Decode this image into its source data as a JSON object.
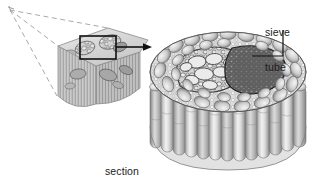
{
  "figure": {
    "background_color": "#ffffff",
    "ink_color": "#1b1b1b"
  },
  "labels": {
    "sieve_tube": {
      "line1": "sieve",
      "line2": "tube",
      "leader": "vertical-then-horizontal-left"
    },
    "section_from_stem": {
      "line1": "section",
      "line2": "from",
      "line3": "a stem"
    }
  },
  "annotations": {
    "magnify_arrow": "arrow-right",
    "magnify_box": "highlight-rectangle-on-stem",
    "projection_lines": "dashed-cone-to-left-vanishing-point"
  },
  "structures": {
    "stem_block": "cut wedge of stem with vertical striations and vascular bundles",
    "cylinder": "magnified cylindrical tissue block",
    "cross_section": "top face with large oval xylem cells and dense dark sieve tube cluster",
    "side_tubes": "vertical rounded tube cells forming the cylinder wall"
  },
  "colors": {
    "ink": "#1b1b1b",
    "dark_cells": "#4a4a4a",
    "mid_grey": "#9a9a9a",
    "light_grey": "#d2d2d2",
    "pale": "#ececec"
  }
}
